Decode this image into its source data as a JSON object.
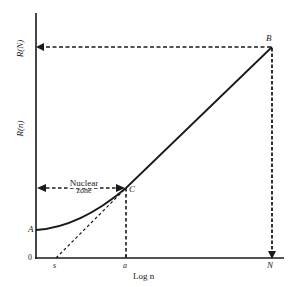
{
  "diagram": {
    "y_axis_labels": {
      "upper": "R(N)",
      "lower": "R(n)"
    },
    "x_axis_label": "Log n",
    "x_ticks": [
      "s",
      "a",
      "N"
    ],
    "origin_label": "0",
    "points": {
      "A": "A",
      "B": "B",
      "C": "C"
    },
    "zone_label_line1": "Nuclear",
    "zone_label_line2": "zone",
    "colors": {
      "ink": "#1a1a1a",
      "background": "#ffffff"
    }
  }
}
